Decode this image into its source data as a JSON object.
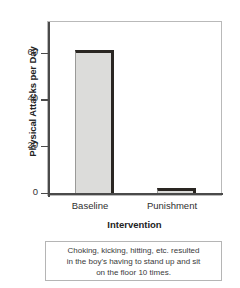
{
  "chart_data": {
    "type": "bar",
    "title": "",
    "categories": [
      "Baseline",
      "Punishment"
    ],
    "values": [
      62,
      2
    ],
    "xlabel": "Intervention",
    "ylabel": "Physical Attacks per Day",
    "ylim": [
      0,
      75
    ],
    "yticks": [
      0,
      20,
      40,
      60
    ],
    "ytick_labels": [
      "0",
      "20",
      "40",
      "60"
    ],
    "grid": false,
    "legend": null,
    "bar_fill_color": "#dcdcda",
    "bar_edge_color": "#2a2622",
    "frame_color": "#b9b9b9",
    "axis_color": "#4a4a4a"
  },
  "caption": {
    "lines": [
      "Choking, kicking, hitting, etc. resulted",
      "in the boy's having to stand up and sit",
      "on the floor 10 times."
    ]
  }
}
